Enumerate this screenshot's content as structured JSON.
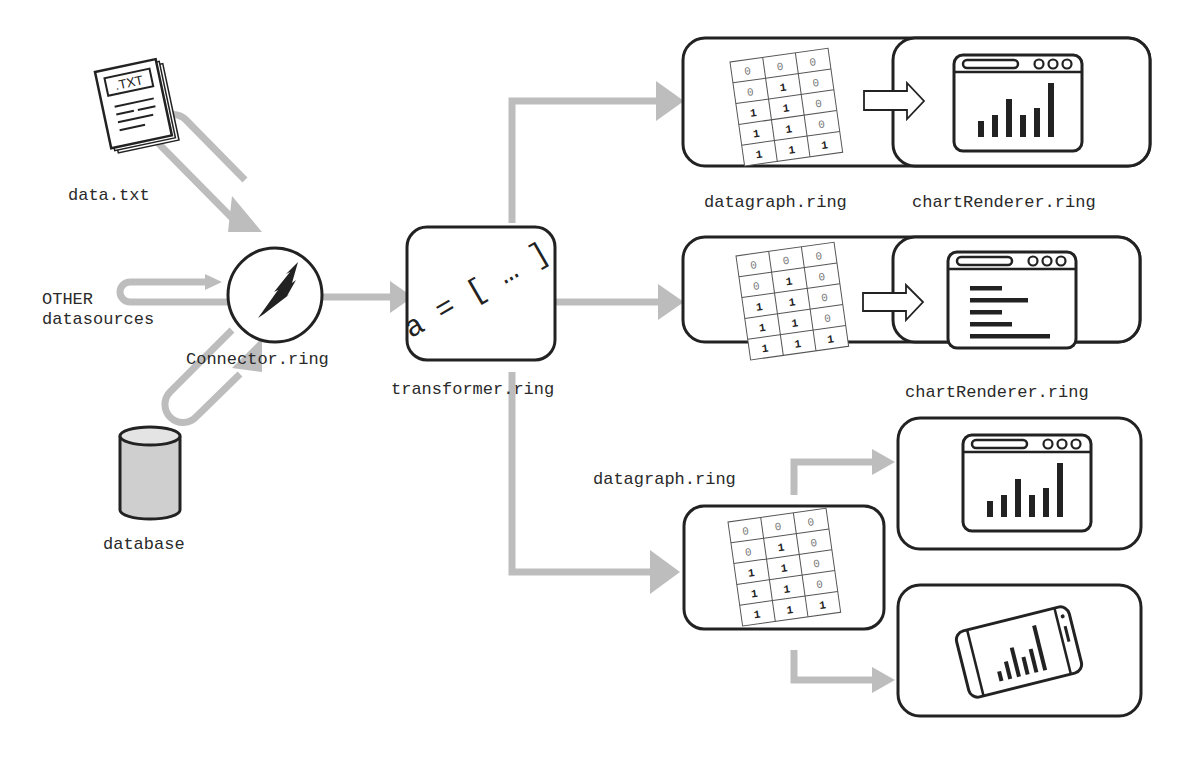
{
  "diagram": {
    "type": "data-flow",
    "colors": {
      "arrow": "#bdbdbd",
      "stroke": "#222222",
      "cylinder_fill": "#cfcfcf",
      "background": "#ffffff"
    },
    "sources": {
      "text_file": {
        "label": "data.txt",
        "icon": "txt-file-icon",
        "badge": ".TXT"
      },
      "other": {
        "label_line1": "OTHER",
        "label_line2": "datasources"
      },
      "database": {
        "label": "database",
        "icon": "database-cylinder-icon"
      }
    },
    "connector": {
      "label": "Connector.ring",
      "icon": "lightning-bolt-icon"
    },
    "transformer": {
      "label": "transformer.ring",
      "code": "a = [ … ]"
    },
    "pipeline_1": {
      "datagraph_label": "datagraph.ring",
      "renderer_label": "chartRenderer.ring",
      "chart": "vertical-bar-chart",
      "bars": [
        3,
        4,
        7,
        4,
        6,
        11
      ]
    },
    "pipeline_2": {
      "renderer_label": "chartRenderer.ring",
      "chart": "horizontal-bar-chart",
      "bars": [
        4,
        8,
        4,
        5,
        11
      ]
    },
    "pipeline_3": {
      "datagraph_label": "datagraph.ring",
      "outputs": [
        "desktop-browser-chart",
        "mobile-phone-chart"
      ]
    },
    "matrix": [
      [
        "0",
        "0",
        "0"
      ],
      [
        "0",
        "1",
        "0"
      ],
      [
        "1",
        "1",
        "0"
      ],
      [
        "1",
        "1",
        "0"
      ],
      [
        "1",
        "1",
        "1"
      ]
    ]
  }
}
